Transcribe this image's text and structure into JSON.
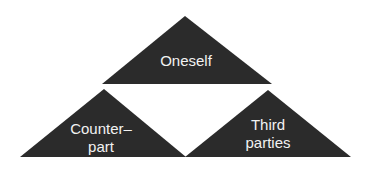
{
  "diagram": {
    "fill_color": "#2b2b2b",
    "text_color": "#f2f2f2",
    "triangles": [
      {
        "id": "top",
        "lines": [
          "Oneself"
        ]
      },
      {
        "id": "left",
        "lines": [
          "Counter–",
          "part"
        ]
      },
      {
        "id": "right",
        "lines": [
          "Third",
          "parties"
        ]
      }
    ]
  }
}
